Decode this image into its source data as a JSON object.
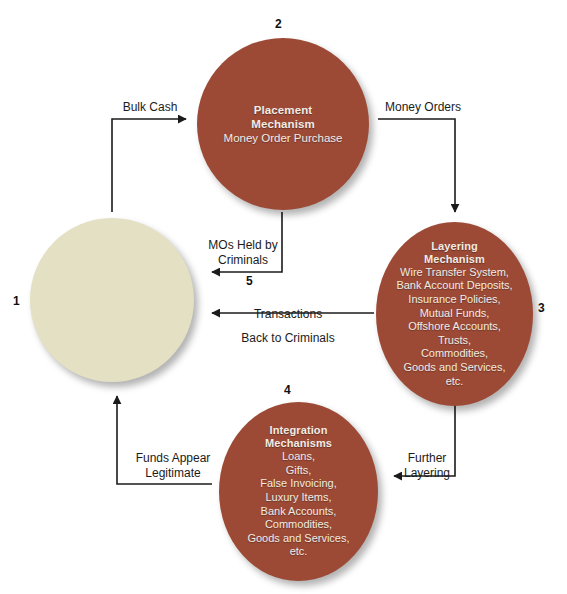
{
  "diagram": {
    "colors": {
      "node_red": "#9c4a36",
      "node_beige": "#e3e0c3",
      "arrow": "#1b1b1b",
      "text_on_red": "#f2ece4"
    },
    "nodes": {
      "criminals": {
        "number": "1",
        "label": ""
      },
      "placement": {
        "number": "2",
        "title_line1": "Placement",
        "title_line2": "Mechanism",
        "lines": [
          "Money Order Purchase"
        ]
      },
      "layering": {
        "number": "3",
        "title_line1": "Layering",
        "title_line2": "Mechanism",
        "lines": [
          "Wire Transfer System,",
          "Bank Account Deposits,",
          "Insurance Policies,",
          "Mutual Funds,",
          "Offshore Accounts,",
          "Trusts,",
          "Commodities,",
          "Goods and Services,",
          "etc."
        ]
      },
      "integration": {
        "number": "4",
        "title_line1": "Integration",
        "title_line2": "Mechanisms",
        "lines": [
          "Loans,",
          "Gifts,",
          "False Invoicing,",
          "Luxury Items,",
          "Bank Accounts,",
          "Commodities,",
          "Goods and Services,",
          "etc."
        ]
      }
    },
    "arrows": {
      "bulk_cash": {
        "label": "Bulk Cash"
      },
      "money_orders": {
        "label": "Money Orders"
      },
      "mos_held": {
        "label_line1": "MOs Held by",
        "label_line2": "Criminals",
        "number": "5"
      },
      "transactions": {
        "label_line1": "Transactions",
        "label_line2": "Back to Criminals"
      },
      "funds_appear": {
        "label_line1": "Funds Appear",
        "label_line2": "Legitimate"
      },
      "further_layering": {
        "label_line1": "Further",
        "label_line2": "Layering"
      }
    }
  }
}
